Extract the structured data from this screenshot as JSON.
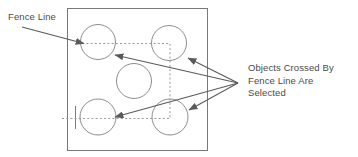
{
  "diagram": {
    "type": "cad-selection-illustration",
    "colors": {
      "stroke": "#6e6e6e",
      "circle_stroke": "#8a8a8a",
      "arrow": "#5a5a5a",
      "fence_dash": "#9a9a9a",
      "text": "#4a4a4a",
      "background": "#ffffff"
    },
    "labels": {
      "fence_line": "Fence Line",
      "objects_crossed": [
        "Objects Crossed By",
        "Fence Line Are",
        "Selected"
      ]
    },
    "frame": {
      "x": 67,
      "y": 8,
      "width": 141,
      "height": 143
    },
    "circles": [
      {
        "name": "circle-top-left",
        "cx": 98,
        "cy": 42,
        "r": 17.5,
        "selected": true
      },
      {
        "name": "circle-top-right",
        "cx": 169,
        "cy": 43,
        "r": 17.5,
        "selected": true
      },
      {
        "name": "circle-middle",
        "cx": 134,
        "cy": 81,
        "r": 17.5,
        "selected": false
      },
      {
        "name": "circle-bottom-left",
        "cx": 98,
        "cy": 117,
        "r": 18.0,
        "selected": true
      },
      {
        "name": "circle-bottom-right",
        "cx": 170,
        "cy": 117,
        "r": 18.0,
        "selected": true
      }
    ],
    "fence_path": {
      "description": "dashed polyline fence crossing four circles",
      "points": [
        {
          "x": 62,
          "y": 118
        },
        {
          "x": 170,
          "y": 118
        },
        {
          "x": 170,
          "y": 43
        },
        {
          "x": 83,
          "y": 43
        }
      ],
      "start_tick": {
        "x": 75,
        "y1": 106,
        "y2": 129
      }
    },
    "leaders": [
      {
        "name": "leader-fence-line",
        "from": {
          "x": 22,
          "y": 27
        },
        "to": {
          "x": 86,
          "y": 44
        }
      },
      {
        "name": "leader-to-top-left-circle",
        "from": {
          "x": 238,
          "y": 83
        },
        "to": {
          "x": 113,
          "y": 54
        }
      },
      {
        "name": "leader-to-top-right-circle",
        "from": {
          "x": 238,
          "y": 83
        },
        "to": {
          "x": 186,
          "y": 58
        }
      },
      {
        "name": "leader-to-bottom-left-circle",
        "from": {
          "x": 238,
          "y": 83
        },
        "to": {
          "x": 113,
          "y": 117
        }
      },
      {
        "name": "leader-to-bottom-right-circle",
        "from": {
          "x": 238,
          "y": 83
        },
        "to": {
          "x": 187,
          "y": 110
        }
      }
    ]
  }
}
